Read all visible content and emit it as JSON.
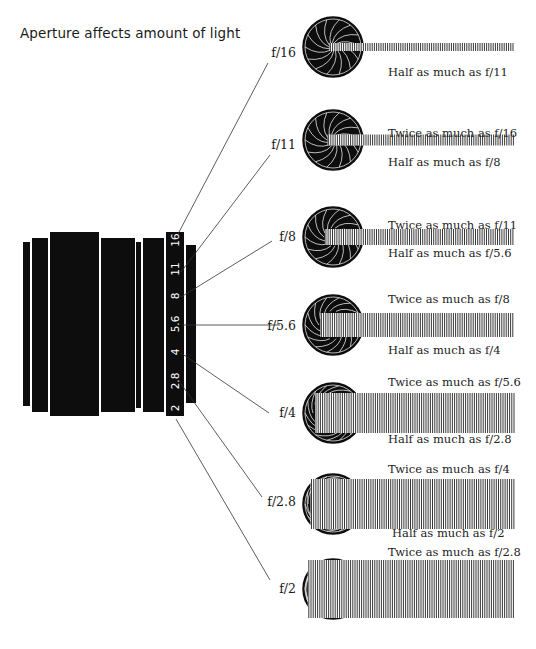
{
  "title": "Aperture affects amount of light",
  "lens": {
    "scale_numbers": [
      "16",
      "11",
      "8",
      "5.6",
      "4",
      "2.8",
      "2"
    ]
  },
  "stops": [
    {
      "label": "f/16",
      "twice": "",
      "half": "Half as much as f/11"
    },
    {
      "label": "f/11",
      "twice": "Twice as much as f/16",
      "half": "Half as much as f/8"
    },
    {
      "label": "f/8",
      "twice": "Twice as much as f/11",
      "half": "Half as much as f/5.6"
    },
    {
      "label": "f/5.6",
      "twice": "Twice as much as f/8",
      "half": "Half as much as f/4"
    },
    {
      "label": "f/4",
      "twice": "Twice as much as f/5.6",
      "half": "Half as much as f/2.8"
    },
    {
      "label": "f/2.8",
      "twice": "Twice as much as f/4",
      "half": "Half as much as f/2"
    },
    {
      "label": "f/2",
      "twice": "Twice as much as f/2.8",
      "half": ""
    }
  ],
  "colors": {
    "ink": "#111111",
    "background": "#ffffff"
  }
}
